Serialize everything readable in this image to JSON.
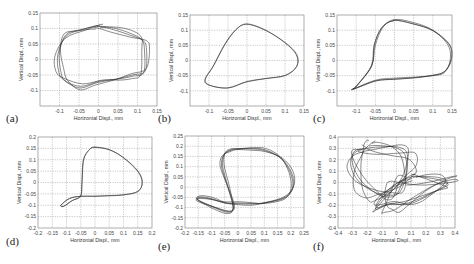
{
  "chart_data": [
    {
      "id": "a",
      "type": "line",
      "panel_label": "(a)",
      "xlabel": "Horizontal Displ., mm",
      "ylabel": "Vertical Displ., mm",
      "xlim": [
        -0.15,
        0.15
      ],
      "ylim": [
        -0.15,
        0.15
      ],
      "xticks": [
        -0.1,
        -0.05,
        0,
        0.05,
        0.1,
        0.15
      ],
      "xtick_labels": [
        "-0.1",
        "-0.05",
        "0",
        "0.05",
        "0.1",
        "0.15"
      ],
      "yticks": [
        -0.1,
        -0.05,
        0,
        0.05,
        0.1,
        0.15
      ],
      "ytick_labels": [
        "-0.1",
        "-0.05",
        "0",
        "0.05",
        "0.1",
        "0.15"
      ],
      "grid": true,
      "box": [
        40,
        13,
        157,
        106
      ],
      "label_pos": [
        6,
        122
      ],
      "loops": 4,
      "spread": 0.008,
      "series": [
        {
          "name": "orbit",
          "x": [
            0.0,
            0.04,
            0.08,
            0.11,
            0.12,
            0.12,
            0.09,
            0.05,
            0.0,
            -0.05,
            -0.09,
            -0.1,
            -0.1,
            -0.08,
            -0.04,
            0.0
          ],
          "y": [
            0.11,
            0.1,
            0.08,
            0.06,
            0.03,
            -0.04,
            -0.05,
            -0.06,
            -0.07,
            -0.09,
            -0.07,
            -0.04,
            0.02,
            0.08,
            0.1,
            0.11
          ]
        }
      ]
    },
    {
      "id": "b",
      "type": "line",
      "panel_label": "(b)",
      "xlabel": "Horizontal Displ., mm",
      "ylabel": "Vertical Displ., mm",
      "xlim": [
        -0.15,
        0.15
      ],
      "ylim": [
        -0.15,
        0.15
      ],
      "xticks": [
        -0.1,
        -0.05,
        0,
        0.05,
        0.1,
        0.15
      ],
      "xtick_labels": [
        "-0.1",
        "-0.05",
        "0",
        "0.05",
        "0.1",
        "0.15"
      ],
      "yticks": [
        -0.1,
        -0.05,
        0,
        0.05,
        0.1,
        0.15
      ],
      "ytick_labels": [
        "-0.1",
        "-0.05",
        "0",
        "0.05",
        "0.1",
        "0.15"
      ],
      "grid": true,
      "box": [
        190,
        15,
        304,
        106
      ],
      "label_pos": [
        158,
        122
      ],
      "loops": 2,
      "spread": 0.002,
      "series": [
        {
          "name": "orbit",
          "x": [
            0.0,
            0.05,
            0.1,
            0.13,
            0.13,
            0.1,
            0.05,
            0.0,
            -0.05,
            -0.1,
            -0.11,
            -0.09,
            -0.06,
            -0.03,
            0.0
          ],
          "y": [
            0.12,
            0.1,
            0.06,
            0.02,
            -0.02,
            -0.05,
            -0.06,
            -0.07,
            -0.09,
            -0.08,
            -0.06,
            -0.02,
            0.05,
            0.1,
            0.12
          ]
        }
      ]
    },
    {
      "id": "c",
      "type": "line",
      "panel_label": "(c)",
      "xlabel": "Horizontal Displ., mm",
      "ylabel": "Vertical Displ., mm",
      "xlim": [
        -0.15,
        0.15
      ],
      "ylim": [
        -0.15,
        0.15
      ],
      "xticks": [
        -0.1,
        -0.05,
        0,
        0.05,
        0.1,
        0.15
      ],
      "xtick_labels": [
        "-0.1",
        "-0.05",
        "0",
        "0.05",
        "0.1",
        "0.15"
      ],
      "yticks": [
        -0.1,
        -0.05,
        0,
        0.05,
        0.1,
        0.15
      ],
      "ytick_labels": [
        "-0.1",
        "-0.05",
        "0",
        "0.05",
        "0.1",
        "0.15"
      ],
      "grid": true,
      "box": [
        337,
        15,
        452,
        106
      ],
      "label_pos": [
        313,
        122
      ],
      "loops": 3,
      "spread": 0.004,
      "series": [
        {
          "name": "orbit",
          "x": [
            0.0,
            0.05,
            0.1,
            0.14,
            0.145,
            0.13,
            0.1,
            0.05,
            0.0,
            -0.05,
            -0.11,
            -0.1,
            -0.06,
            -0.05,
            -0.03,
            0.0
          ],
          "y": [
            0.135,
            0.125,
            0.1,
            0.05,
            0.0,
            -0.04,
            -0.05,
            -0.055,
            -0.058,
            -0.065,
            -0.095,
            -0.085,
            -0.02,
            0.05,
            0.11,
            0.135
          ]
        }
      ]
    },
    {
      "id": "d",
      "type": "line",
      "panel_label": "(d)",
      "xlabel": "Horizontal Displ., mm",
      "ylabel": "Vertical Displ., mm",
      "xlim": [
        -0.2,
        0.2
      ],
      "ylim": [
        -0.2,
        0.2
      ],
      "xticks": [
        -0.2,
        -0.15,
        -0.1,
        -0.05,
        0,
        0.05,
        0.1,
        0.15,
        0.2
      ],
      "xtick_labels": [
        "-0.2",
        "-0.15",
        "-0.1",
        "-0.05",
        "0",
        "0.05",
        "0.1",
        "0.15",
        "0.2"
      ],
      "yticks": [
        -0.2,
        -0.15,
        -0.1,
        -0.05,
        0,
        0.05,
        0.1,
        0.15,
        0.2
      ],
      "ytick_labels": [
        "-0.2",
        "-0.15",
        "-0.1",
        "-0.05",
        "0",
        "0.05",
        "0.1",
        "0.15",
        "0.2"
      ],
      "grid": true,
      "box": [
        38,
        137,
        152,
        228
      ],
      "label_pos": [
        6,
        245
      ],
      "loops": 2,
      "spread": 0.002,
      "series": [
        {
          "name": "orbit",
          "x": [
            0.0,
            0.05,
            0.1,
            0.15,
            0.165,
            0.15,
            0.1,
            0.05,
            0.0,
            -0.05,
            -0.09,
            -0.12,
            -0.11,
            -0.08,
            -0.05,
            -0.045,
            -0.04,
            -0.02,
            0.0
          ],
          "y": [
            0.155,
            0.145,
            0.11,
            0.05,
            0.0,
            -0.04,
            -0.055,
            -0.058,
            -0.06,
            -0.06,
            -0.07,
            -0.1,
            -0.105,
            -0.08,
            -0.06,
            0.0,
            0.1,
            0.145,
            0.155
          ]
        }
      ]
    },
    {
      "id": "e",
      "type": "line",
      "panel_label": "(e)",
      "xlabel": "Horizontal Displ., mm",
      "ylabel": "Vertical Displ., mm",
      "xlim": [
        -0.2,
        0.25
      ],
      "ylim": [
        -0.2,
        0.25
      ],
      "xticks": [
        -0.2,
        -0.15,
        -0.1,
        -0.05,
        0,
        0.05,
        0.1,
        0.15,
        0.2,
        0.25
      ],
      "xtick_labels": [
        "-0.2",
        "-0.15",
        "-0.1",
        "-0.05",
        "0",
        "0.05",
        "0.1",
        "0.15",
        "0.2",
        "0.25"
      ],
      "yticks": [
        -0.2,
        -0.15,
        -0.1,
        -0.05,
        0,
        0.05,
        0.1,
        0.15,
        0.2,
        0.25
      ],
      "ytick_labels": [
        "-0.2",
        "-0.15",
        "-0.1",
        "-0.05",
        "0",
        "0.05",
        "0.1",
        "0.15",
        "0.2",
        "0.25"
      ],
      "grid": true,
      "box": [
        185,
        136,
        304,
        228
      ],
      "label_pos": [
        158,
        250
      ],
      "loops": 4,
      "spread": 0.006,
      "series": [
        {
          "name": "orbit",
          "x": [
            0.0,
            0.05,
            0.1,
            0.16,
            0.2,
            0.21,
            0.18,
            0.1,
            0.05,
            0.0,
            -0.05,
            -0.1,
            -0.14,
            -0.15,
            -0.1,
            -0.04,
            -0.02,
            -0.04,
            -0.06,
            -0.05,
            -0.02,
            0.0
          ],
          "y": [
            0.19,
            0.19,
            0.18,
            0.14,
            0.07,
            0.0,
            -0.05,
            -0.075,
            -0.08,
            -0.08,
            -0.08,
            -0.06,
            -0.05,
            -0.06,
            -0.09,
            -0.12,
            -0.1,
            0.0,
            0.1,
            0.16,
            0.185,
            0.19
          ]
        }
      ]
    },
    {
      "id": "f",
      "type": "line",
      "panel_label": "(f)",
      "xlabel": "Horizontal Displ., mm",
      "ylabel": "Vertical Displ., mm",
      "xlim": [
        -0.4,
        0.4
      ],
      "ylim": [
        -0.4,
        0.4
      ],
      "xticks": [
        -0.4,
        -0.3,
        -0.2,
        -0.1,
        0,
        0.1,
        0.2,
        0.3,
        0.4
      ],
      "xtick_labels": [
        "-0.4",
        "-0.3",
        "-0.2",
        "-0.1",
        "0",
        "0.1",
        "0.2",
        "0.3",
        "0.4"
      ],
      "yticks": [
        -0.4,
        -0.3,
        -0.2,
        -0.1,
        0,
        0.1,
        0.2,
        0.3,
        0.4
      ],
      "ytick_labels": [
        "-0.4",
        "-0.3",
        "-0.2",
        "-0.1",
        "0",
        "0.1",
        "0.2",
        "0.3",
        "0.4"
      ],
      "grid": true,
      "box": [
        338,
        137,
        455,
        228
      ],
      "label_pos": [
        313,
        250
      ],
      "loops": 6,
      "spread": 0.025,
      "series": [
        {
          "name": "orbit",
          "x": [
            -0.2,
            -0.1,
            0.0,
            0.07,
            0.08,
            0.05,
            0.0,
            -0.08,
            -0.15,
            -0.25,
            -0.3,
            -0.28,
            -0.2
          ],
          "y": [
            0.31,
            0.31,
            0.3,
            0.25,
            0.1,
            0.0,
            -0.1,
            -0.12,
            -0.1,
            0.0,
            0.15,
            0.27,
            0.31
          ]
        },
        {
          "name": "orbit-2",
          "x": [
            0.1,
            0.2,
            0.3,
            0.36,
            0.33,
            0.25,
            0.15,
            0.05,
            -0.05,
            -0.12,
            -0.13,
            -0.08,
            0.0,
            0.1
          ],
          "y": [
            0.04,
            0.04,
            0.03,
            0.0,
            -0.03,
            -0.08,
            -0.15,
            -0.2,
            -0.2,
            -0.23,
            -0.2,
            -0.1,
            0.0,
            0.04
          ]
        }
      ]
    }
  ]
}
